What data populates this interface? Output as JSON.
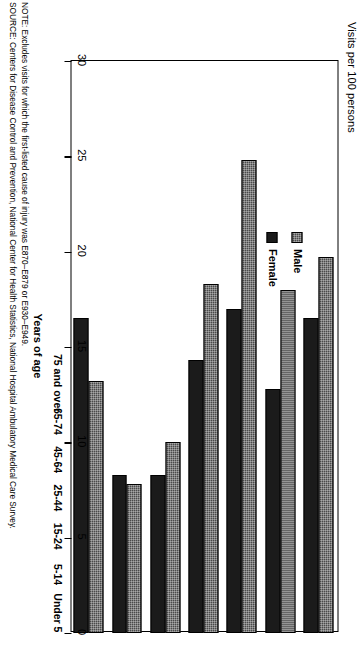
{
  "chart_data": {
    "type": "bar",
    "title": "",
    "ylabel": "Visits per 100 persons",
    "xlabel": "Years of age",
    "categories": [
      "Under 5",
      "5-14",
      "15-24",
      "25-44",
      "45-64",
      "65-74",
      "75 and over"
    ],
    "series": [
      {
        "name": "Male",
        "color": "#4a4a4a",
        "values": [
          19.7,
          18.0,
          24.8,
          18.3,
          10.0,
          7.8,
          13.2
        ]
      },
      {
        "name": "Female",
        "color": "#1b1b1b",
        "values": [
          16.5,
          12.8,
          17.0,
          14.3,
          8.3,
          8.3,
          16.5
        ]
      }
    ],
    "ylim": [
      0,
      30
    ],
    "yticks": [
      0,
      5,
      10,
      15,
      20,
      25,
      30
    ],
    "ytick_labels": [
      "0",
      "5",
      "10",
      "15",
      "20",
      "25",
      "30"
    ],
    "grid": false,
    "legend_position": "upper-right",
    "orientation": "vertical-rotated-90ccw"
  },
  "legend": {
    "items": [
      {
        "label": "Male"
      },
      {
        "label": "Female"
      }
    ]
  },
  "notes": {
    "note": "NOTE: Excludes visits for which the first-listed cause of injury was E870–E879 or E930–E949.",
    "source": "SOURCE: Centers for Disease Control and Prevention, National Center for Health Statistics, National Hospital Ambulatory Medical Care Survey."
  }
}
